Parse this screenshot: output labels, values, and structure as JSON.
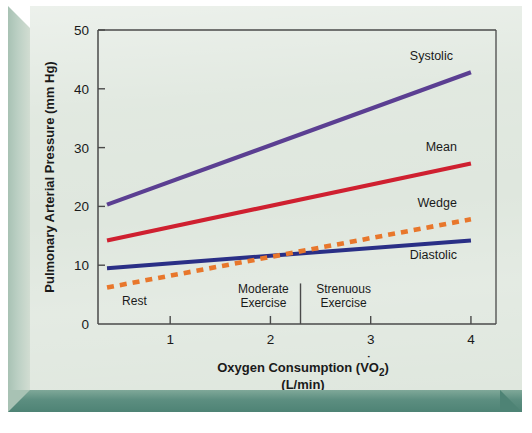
{
  "chart_data": {
    "type": "line",
    "title": "",
    "xlabel": "Oxygen Consumption (V̇O₂)",
    "xlabel_line1": "Oxygen Consumption (V",
    "xlabel_sub": "O",
    "xlabel_sub2": "2",
    "xlabel_line2": "(L/min)",
    "ylabel": "Pulmonary Arterial Pressure (mm Hg)",
    "xlim": [
      0.28,
      4.25
    ],
    "ylim": [
      0,
      50
    ],
    "xticks": [
      1,
      2,
      3,
      4
    ],
    "xtick_labels": [
      "1",
      "2",
      "3",
      "4"
    ],
    "yticks": [
      0,
      10,
      20,
      30,
      40,
      50
    ],
    "ytick_labels": [
      "0",
      "10",
      "20",
      "30",
      "40",
      "50"
    ],
    "grid": false,
    "legend_position": "inline-right-of-line-ends",
    "series": [
      {
        "name": "Systolic",
        "label": "Systolic",
        "color": "#5b3f92",
        "style": "solid",
        "width": 4.2,
        "x": [
          0.37,
          4.0
        ],
        "values": [
          20.3,
          42.8
        ]
      },
      {
        "name": "Mean",
        "label": "Mean",
        "color": "#cf2030",
        "style": "solid",
        "width": 4.2,
        "x": [
          0.37,
          4.0
        ],
        "values": [
          14.2,
          27.3
        ]
      },
      {
        "name": "Wedge",
        "label": "Wedge",
        "color": "#e8772c",
        "style": "dashed",
        "width": 4.6,
        "x": [
          0.37,
          4.0
        ],
        "values": [
          6.2,
          17.8
        ]
      },
      {
        "name": "Diastolic",
        "label": "Diastolic",
        "color": "#2a2f86",
        "style": "solid",
        "width": 4.0,
        "x": [
          0.37,
          4.0
        ],
        "values": [
          9.5,
          14.2
        ]
      }
    ],
    "annotations": [
      {
        "name": "rest-zone",
        "text": "Rest",
        "x": 0.52,
        "y": 3.3
      },
      {
        "name": "moderate-zone",
        "text_line1": "Moderate",
        "text_line2": "Exercise",
        "x": 1.93,
        "y": 5.2
      },
      {
        "name": "strenuous-zone",
        "text_line1": "Strenuous",
        "text_line2": "Exercise",
        "x": 2.73,
        "y": 5.2
      }
    ],
    "zone_divider": {
      "name": "zone-divider",
      "x": 2.3,
      "y_top": 6.9,
      "y_bottom": 0
    }
  },
  "colors": {
    "card_background": "#dfe7de",
    "frame_bevel_dark": "#4e8375",
    "frame_bevel_light": "#bcd0c4",
    "axis": "#4a4a4a",
    "text": "#1a1a1a",
    "systolic": "#5b3f92",
    "mean": "#cf2030",
    "wedge": "#e8772c",
    "diastolic": "#2a2f86"
  }
}
